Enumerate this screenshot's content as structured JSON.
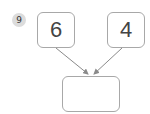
{
  "question": {
    "number": "9",
    "addends": [
      "6",
      "4"
    ],
    "answer": ""
  },
  "colors": {
    "badge_bg": "#dcdcdc",
    "box_border": "#a8a8a8",
    "arrow": "#8a8a8a"
  }
}
